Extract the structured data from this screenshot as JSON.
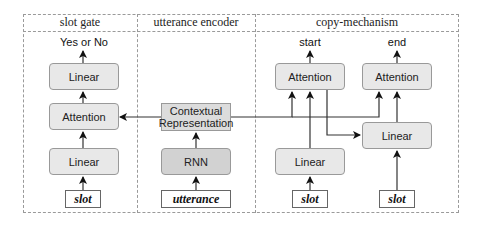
{
  "sections": [
    {
      "id": "slot-gate",
      "title": "slot gate"
    },
    {
      "id": "utterance-encoder",
      "title": "utterance encoder"
    },
    {
      "id": "copy-mechanism",
      "title": "copy-mechanism"
    }
  ],
  "slot_gate": {
    "output": "Yes or No",
    "linear_top": "Linear",
    "attention": "Attention",
    "linear_bottom": "Linear",
    "input": "slot"
  },
  "utterance_encoder": {
    "contextual_line1": "Contextual",
    "contextual_line2": "Representation",
    "rnn": "RNN",
    "input": "utterance"
  },
  "copy_mechanism": {
    "output_start": "start",
    "output_end": "end",
    "attention_start": "Attention",
    "attention_end": "Attention",
    "linear_right": "Linear",
    "linear_left": "Linear",
    "input_left": "slot",
    "input_right": "slot"
  }
}
